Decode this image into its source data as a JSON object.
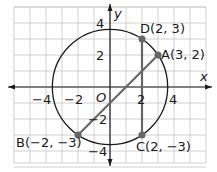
{
  "diagram": {
    "origin_label": "O",
    "x_axis_label": "x",
    "y_axis_label": "y",
    "x_ticks": [
      {
        "value": -4,
        "label": "−4"
      },
      {
        "value": -2,
        "label": "−2"
      },
      {
        "value": 2,
        "label": "2"
      },
      {
        "value": 4,
        "label": "4"
      }
    ],
    "y_ticks": [
      {
        "value": 4,
        "label": "4"
      },
      {
        "value": 2,
        "label": "2"
      },
      {
        "value": -2,
        "label": "−2"
      },
      {
        "value": -4,
        "label": "−4"
      }
    ],
    "circle": {
      "center": [
        0,
        0
      ],
      "radius_squared": 13
    },
    "points": [
      {
        "name": "A",
        "x": 3,
        "y": 2,
        "label": "A(3, 2)"
      },
      {
        "name": "B",
        "x": -2,
        "y": -3,
        "label": "B(−2, −3)"
      },
      {
        "name": "C",
        "x": 2,
        "y": -3,
        "label": "C(2, −3)"
      },
      {
        "name": "D",
        "x": 2,
        "y": 3,
        "label": "D(2, 3)"
      }
    ],
    "segments": [
      {
        "from": "B",
        "to": "A"
      },
      {
        "from": "D",
        "to": "C"
      }
    ],
    "colors": {
      "grid": "#d0d0d0",
      "axis": "#1a1a1a",
      "circle": "#1a1a1a",
      "segment": "#666666",
      "point": "#666666"
    }
  }
}
